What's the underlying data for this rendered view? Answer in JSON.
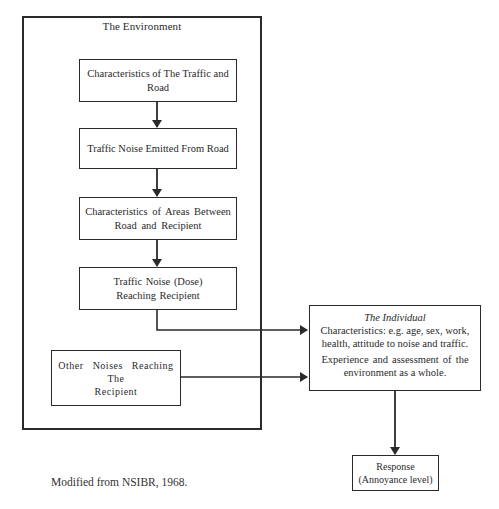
{
  "diagram": {
    "environment": {
      "label": "The Environment"
    },
    "nodes": [
      {
        "id": "traffic-road",
        "lines": [
          "Characteristics of The Traffic and",
          "Road"
        ]
      },
      {
        "id": "noise-emitted",
        "lines": [
          "Traffic Noise Emitted From Road"
        ]
      },
      {
        "id": "areas",
        "lines": [
          "Characteristics of Areas Between",
          "Road and Recipient"
        ]
      },
      {
        "id": "dose",
        "lines": [
          "Traffic Noise (Dose)",
          "Reaching Recipient"
        ]
      },
      {
        "id": "other",
        "lines": [
          "Other Noises Reaching",
          "The",
          "Recipient"
        ]
      }
    ],
    "individual": {
      "title": "The Individual",
      "para1_lines": [
        "Characteristics: e.g. age, sex, work,",
        "health, attitude to noise and traffic."
      ],
      "para2_lines": [
        "Experience and assessment of the",
        "environment as a whole."
      ]
    },
    "response": {
      "lines": [
        "Response",
        "(Annoyance level)"
      ]
    },
    "edges": [
      {
        "from": "traffic-road",
        "to": "noise-emitted"
      },
      {
        "from": "noise-emitted",
        "to": "areas"
      },
      {
        "from": "areas",
        "to": "dose"
      },
      {
        "from": "dose",
        "to": "individual"
      },
      {
        "from": "other",
        "to": "individual"
      },
      {
        "from": "individual",
        "to": "response"
      }
    ]
  },
  "caption": "Modified from NSIBR, 1968."
}
